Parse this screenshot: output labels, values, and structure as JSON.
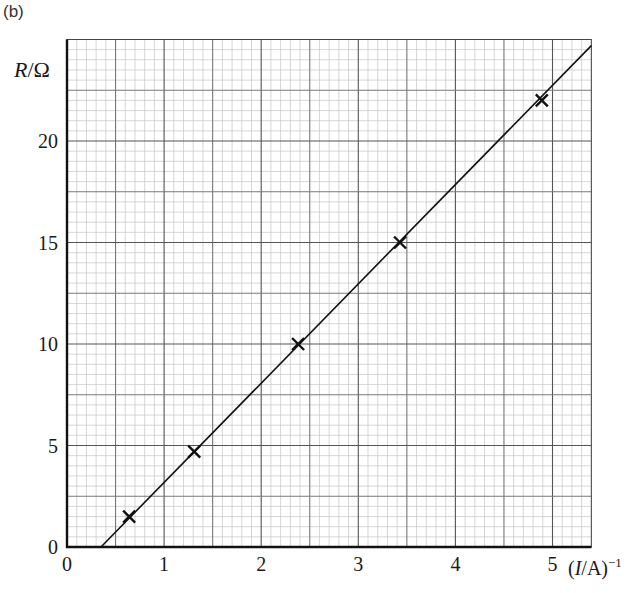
{
  "figure": {
    "part_label": "(b)",
    "y_axis_label_var": "R",
    "y_axis_label_unit": "/Ω",
    "x_axis_label_var": "I",
    "x_axis_label_unit": "/A)",
    "x_axis_label_open": "(",
    "x_axis_label_exp": "−1"
  },
  "chart_data": {
    "type": "scatter",
    "title": "",
    "xlabel": "(I/A)^-1",
    "ylabel": "R/Ω",
    "xlim": [
      0,
      5.4
    ],
    "ylim": [
      0,
      25
    ],
    "x_ticks": [
      0,
      1,
      2,
      3,
      4,
      5
    ],
    "y_ticks": [
      0,
      5,
      10,
      15,
      20
    ],
    "grid": true,
    "grid_minor_x": 0.1,
    "grid_minor_y": 0.5,
    "legend": null,
    "series": [
      {
        "name": "measurements",
        "marker": "x",
        "x": [
          0.64,
          1.31,
          2.38,
          3.43,
          4.89
        ],
        "y": [
          1.5,
          4.7,
          10.0,
          15.0,
          22.0
        ]
      },
      {
        "name": "best-fit line",
        "type": "line",
        "x": [
          0.35,
          5.4
        ],
        "y": [
          0.0,
          24.7
        ]
      }
    ]
  }
}
